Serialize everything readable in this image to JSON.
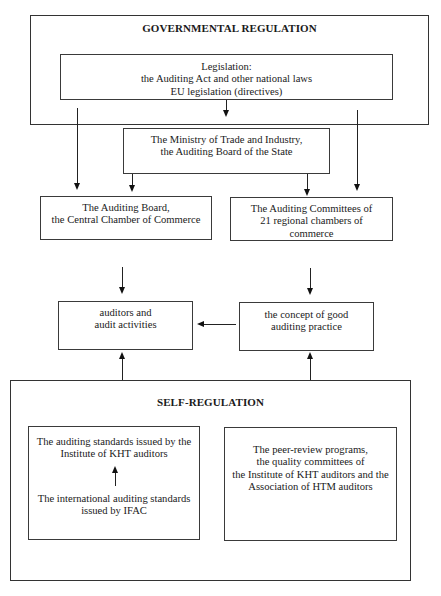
{
  "diagram": {
    "header_fragment": "g",
    "governmental": {
      "title": "GOVERNMENTAL REGULATION",
      "legislation": {
        "lines": [
          "Legislation:",
          "the Auditing Act and other national laws",
          "EU legislation (directives)"
        ]
      },
      "ministry": {
        "lines": [
          "The Ministry of Trade and Industry,",
          "the Auditing Board of the State"
        ]
      },
      "auditing_board": {
        "lines": [
          "The Auditing Board,",
          "the Central Chamber of Commerce"
        ]
      },
      "auditing_committees": {
        "lines": [
          "The Auditing Committees of",
          "21 regional chambers of",
          "commerce"
        ]
      }
    },
    "middle": {
      "auditors": {
        "lines": [
          "auditors and",
          "audit activities"
        ]
      },
      "concept": {
        "lines": [
          "the concept of good",
          "auditing practice"
        ]
      }
    },
    "self_regulation": {
      "title": "SELF-REGULATION",
      "standards": {
        "top_lines": [
          "The auditing standards issued by the",
          "Institute of KHT auditors"
        ],
        "bottom_lines": [
          "The international auditing standards",
          "issued by IFAC"
        ]
      },
      "peer_review": {
        "lines": [
          "The peer-review programs,",
          "the quality committees of",
          "the Institute of KHT auditors and the",
          "Association of HTM auditors"
        ]
      }
    },
    "colors": {
      "line": "#222222",
      "border": "#3a3a3a",
      "background": "#ffffff",
      "text": "#1a1a1a"
    }
  }
}
